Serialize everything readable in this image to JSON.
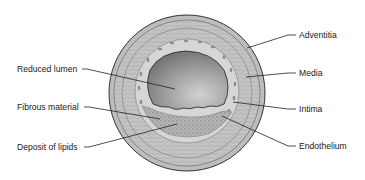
{
  "diagram": {
    "labels_left": [
      {
        "id": "reduced-lumen",
        "text": "Reduced lumen",
        "x": 17,
        "y": 64
      },
      {
        "id": "fibrous-material",
        "text": "Fibrous material",
        "x": 17,
        "y": 102
      },
      {
        "id": "deposit-of-lipids",
        "text": "Deposit of lipids",
        "x": 17,
        "y": 142
      }
    ],
    "labels_right": [
      {
        "id": "adventitia",
        "text": "Adventitia",
        "x": 299,
        "y": 31
      },
      {
        "id": "media",
        "text": "Media",
        "x": 299,
        "y": 69
      },
      {
        "id": "intima",
        "text": "Intima",
        "x": 299,
        "y": 105
      },
      {
        "id": "endothelium",
        "text": "Endothelium",
        "x": 299,
        "y": 141
      }
    ],
    "colors": {
      "outline": "#3a3a3a",
      "adventitia": "#b9b9b9",
      "media": "#cfcfcf",
      "intima": "#d8d8d8",
      "lumen_light": "#c8c8c8",
      "lumen_dark": "#6e6e6e",
      "plaque": "#a9a9a9",
      "leader": "#222222"
    }
  }
}
